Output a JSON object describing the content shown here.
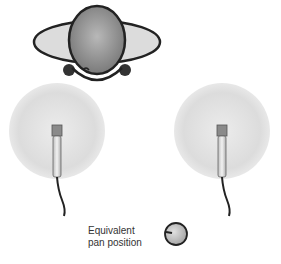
{
  "diagram": {
    "label_lines": [
      "Equivalent",
      "pan position"
    ],
    "elements": {
      "listener": "top-view-head-with-headphones",
      "left_mic": "omnidirectional-microphone-left",
      "right_mic": "omnidirectional-microphone-right",
      "pan_knob": "pan-knob-turned-left"
    },
    "colors": {
      "outline": "#222222",
      "head_fill": "#9a9a9a",
      "ear_fill": "#dcdcdc",
      "pickup_fill": "#e2e2e2",
      "mic_body": "#d8d8d8",
      "knob_fill": "#c8c8c8"
    }
  }
}
